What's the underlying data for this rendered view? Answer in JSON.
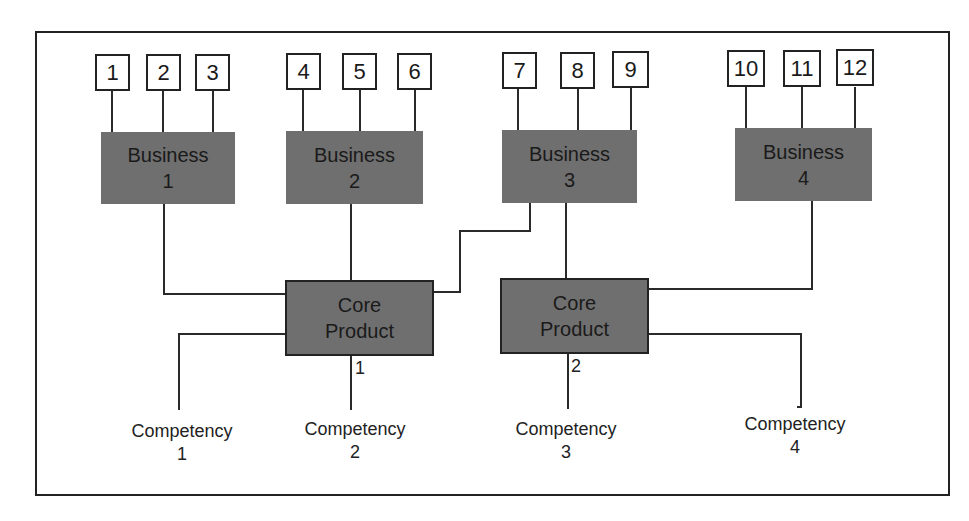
{
  "diagram": {
    "title": "",
    "products": [
      {
        "label": "1"
      },
      {
        "label": "2"
      },
      {
        "label": "3"
      },
      {
        "label": "4"
      },
      {
        "label": "5"
      },
      {
        "label": "6"
      },
      {
        "label": "7"
      },
      {
        "label": "8"
      },
      {
        "label": "9"
      },
      {
        "label": "10"
      },
      {
        "label": "11"
      },
      {
        "label": "12"
      }
    ],
    "businesses": [
      {
        "line1": "Business",
        "line2": "1",
        "products": [
          "1",
          "2",
          "3"
        ]
      },
      {
        "line1": "Business",
        "line2": "2",
        "products": [
          "4",
          "5",
          "6"
        ]
      },
      {
        "line1": "Business",
        "line2": "3",
        "products": [
          "7",
          "8",
          "9"
        ]
      },
      {
        "line1": "Business",
        "line2": "4",
        "products": [
          "10",
          "11",
          "12"
        ]
      }
    ],
    "core_products": [
      {
        "line1": "Core",
        "line2": "Product",
        "number": "1",
        "businesses": [
          "Business 1",
          "Business 2",
          "Business 3"
        ],
        "competencies": [
          "Competency 1",
          "Competency 2"
        ]
      },
      {
        "line1": "Core",
        "line2": "Product",
        "number": "2",
        "businesses": [
          "Business 3",
          "Business 4"
        ],
        "competencies": [
          "Competency 3",
          "Competency 4"
        ]
      }
    ],
    "competencies": [
      {
        "line1": "Competency",
        "line2": "1"
      },
      {
        "line1": "Competency",
        "line2": "2"
      },
      {
        "line1": "Competency",
        "line2": "3"
      },
      {
        "line1": "Competency",
        "line2": "4"
      }
    ],
    "colors": {
      "node_fill": "#6f6f6f",
      "line": "#2a2a2a",
      "background": "#ffffff"
    }
  }
}
